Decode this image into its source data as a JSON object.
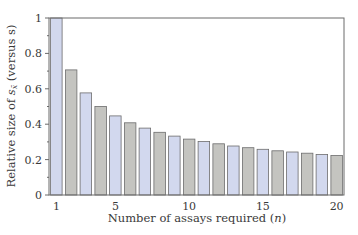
{
  "chart_data": {
    "type": "bar",
    "title": "",
    "xlabel": "Number of assays required (n)",
    "xlabel_parts": {
      "text": "Number of assays required (",
      "var": "n",
      "close": ")"
    },
    "ylabel": "Relative size of s_x̄ (versus s)",
    "ylabel_parts": {
      "pre": "Relative size of ",
      "var": "s",
      "sub": "x̄",
      "post": " (versus s)"
    },
    "categories": [
      1,
      2,
      3,
      4,
      5,
      6,
      7,
      8,
      9,
      10,
      11,
      12,
      13,
      14,
      15,
      16,
      17,
      18,
      19,
      20
    ],
    "values": [
      1.0,
      0.707,
      0.577,
      0.5,
      0.447,
      0.408,
      0.378,
      0.354,
      0.333,
      0.316,
      0.302,
      0.289,
      0.277,
      0.267,
      0.258,
      0.25,
      0.243,
      0.236,
      0.229,
      0.224
    ],
    "ylim": [
      0,
      1
    ],
    "xlim": [
      0.5,
      20.5
    ],
    "yticks": [
      0,
      0.2,
      0.4,
      0.6,
      0.8,
      1
    ],
    "ytick_labels": [
      "0",
      "0.2",
      "0.4",
      "0.6",
      "0.8",
      "1"
    ],
    "xticks": [
      1,
      5,
      10,
      15,
      20
    ],
    "xtick_labels": [
      "1",
      "5",
      "10",
      "15",
      "20"
    ],
    "grid": false,
    "legend": null,
    "colors": {
      "odd_bar": "#d2d8ee",
      "even_bar": "#c4c4c0",
      "bar_edge": "#6d6d6d",
      "axis": "#6a6a6a"
    }
  }
}
